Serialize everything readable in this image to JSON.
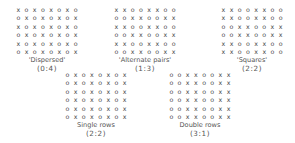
{
  "figure": {
    "symbols": {
      "species_a": "x",
      "species_b": "o"
    },
    "panels": [
      {
        "label": "'Dispersed'",
        "ratio": "(0:4)",
        "rows": [
          "xoxoxoxo",
          "oxoxoxox",
          "xoxoxoxo",
          "oxoxoxox",
          "xoxoxoxo",
          "oxoxoxox"
        ]
      },
      {
        "label": "'Alternate pairs'",
        "ratio": "(1:3)",
        "rows": [
          "xxooxxoo",
          "ooxxooxx",
          "xxooxxoo",
          "ooxxooxx",
          "xxooxxoo",
          "ooxxooxx"
        ]
      },
      {
        "label": "'Squares'",
        "ratio": "(2:2)",
        "rows": [
          "xxooxxoo",
          "xxooxxoo",
          "ooxxooxx",
          "ooxxooxx",
          "xxooxxoo",
          "xxooxxoo"
        ]
      },
      {
        "label": "Single rows",
        "ratio": "(2:2)",
        "rows": [
          "oxoxoxox",
          "oxoxoxox",
          "oxoxoxox",
          "oxoxoxox",
          "oxoxoxox",
          "oxoxoxox"
        ]
      },
      {
        "label": "Double rows",
        "ratio": "(3:1)",
        "rows": [
          "ooxxooxx",
          "ooxxooxx",
          "ooxxooxx",
          "ooxxooxx",
          "ooxxooxx",
          "ooxxooxx"
        ]
      }
    ]
  }
}
